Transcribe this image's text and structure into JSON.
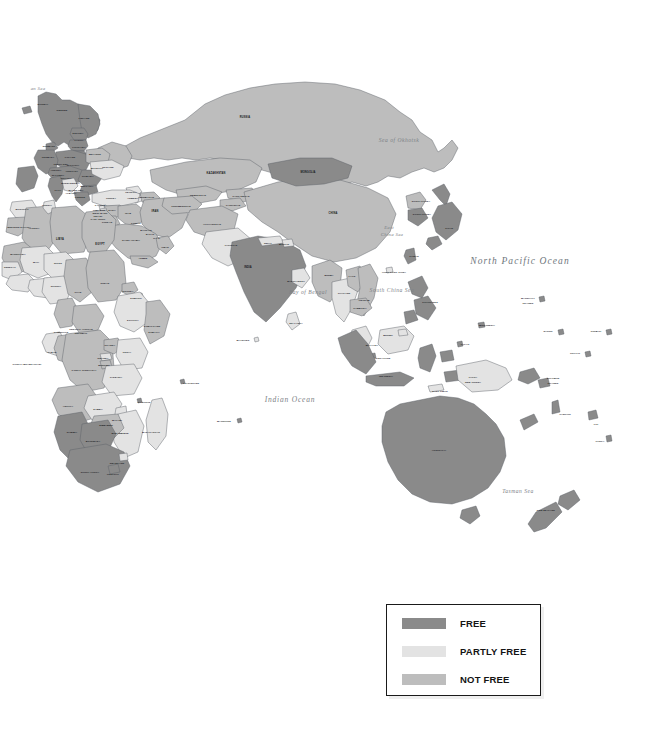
{
  "document": {
    "type": "world-freedom-map",
    "region_focus": "Europe, Africa, Asia, Oceania",
    "background_color": "#ffffff"
  },
  "legend": {
    "name": "freedom-status-legend",
    "border_color": "#1a1a1a",
    "items": [
      {
        "label": "FREE",
        "color": "#8a8a8a"
      },
      {
        "label": "PARTLY FREE",
        "color": "#e3e3e3"
      },
      {
        "label": "NOT FREE",
        "color": "#bdbdbd"
      }
    ]
  },
  "palette": {
    "free": "#8a8a8a",
    "partly_free": "#e3e3e3",
    "not_free": "#bdbdbd",
    "border": "#5b6066",
    "ocean": "#ffffff",
    "ocean_text": "#7c8186",
    "land_text": "#15171a"
  },
  "water_labels": [
    {
      "text": "an Sea",
      "x": 38,
      "y": 88,
      "size": "tiny"
    },
    {
      "text": "Sea of Okhotsk",
      "x": 399,
      "y": 140,
      "size": "sml"
    },
    {
      "text": "North Pacific Ocean",
      "x": 520,
      "y": 261,
      "size": "big"
    },
    {
      "text": "East",
      "x": 389,
      "y": 227,
      "size": "tiny"
    },
    {
      "text": "China Sea",
      "x": 392,
      "y": 234,
      "size": "tiny"
    },
    {
      "text": "South China Sea",
      "x": 392,
      "y": 290,
      "size": "sml"
    },
    {
      "text": "Bay of Bengal",
      "x": 308,
      "y": 292,
      "size": "sml"
    },
    {
      "text": "Indian Ocean",
      "x": 290,
      "y": 399,
      "size": "mid"
    },
    {
      "text": "Tasman Sea",
      "x": 518,
      "y": 491,
      "size": "sml"
    }
  ],
  "country_labels": [
    {
      "text": "NORWAY",
      "x": 43,
      "y": 104,
      "cls": "xs"
    },
    {
      "text": "SWEDEN",
      "x": 62,
      "y": 110,
      "cls": "xs"
    },
    {
      "text": "FINLAND",
      "x": 84,
      "y": 118,
      "cls": "xs"
    },
    {
      "text": "ESTONIA",
      "x": 78,
      "y": 133,
      "cls": "xs"
    },
    {
      "text": "LATVIA",
      "x": 79,
      "y": 140,
      "cls": "xs"
    },
    {
      "text": "LITHUANIA",
      "x": 79,
      "y": 147,
      "cls": "xs"
    },
    {
      "text": "DENMARK",
      "x": 49,
      "y": 146,
      "cls": "xs"
    },
    {
      "text": "BELARUS",
      "x": 95,
      "y": 154,
      "cls": "xs"
    },
    {
      "text": "POLAND",
      "x": 70,
      "y": 157,
      "cls": "xs"
    },
    {
      "text": "GERMANY",
      "x": 48,
      "y": 157,
      "cls": "xs"
    },
    {
      "text": "RUSSIA",
      "x": 245,
      "y": 118,
      "cls": "sm"
    },
    {
      "text": "UKRAINE",
      "x": 108,
      "y": 167,
      "cls": "xs"
    },
    {
      "text": "MOLDOVA",
      "x": 97,
      "y": 168,
      "cls": "xs"
    },
    {
      "text": "CZECH REP.",
      "x": 61,
      "y": 164,
      "cls": "xs"
    },
    {
      "text": "SLOVAKIA",
      "x": 73,
      "y": 165,
      "cls": "xs"
    },
    {
      "text": "AUSTRIA",
      "x": 56,
      "y": 170,
      "cls": "xs"
    },
    {
      "text": "HUNGARY",
      "x": 72,
      "y": 171,
      "cls": "xs"
    },
    {
      "text": "SLOVENIA",
      "x": 58,
      "y": 175,
      "cls": "xs"
    },
    {
      "text": "CROATIA",
      "x": 66,
      "y": 178,
      "cls": "xs"
    },
    {
      "text": "ROMANIA",
      "x": 88,
      "y": 176,
      "cls": "xs"
    },
    {
      "text": "BOSNIA",
      "x": 66,
      "y": 183,
      "cls": "xs"
    },
    {
      "text": "SERBIA",
      "x": 75,
      "y": 183,
      "cls": "xs"
    },
    {
      "text": "BULGARIA",
      "x": 87,
      "y": 186,
      "cls": "xs"
    },
    {
      "text": "ITALY",
      "x": 58,
      "y": 190,
      "cls": "xs"
    },
    {
      "text": "MACEDONIA",
      "x": 76,
      "y": 190,
      "cls": "xs"
    },
    {
      "text": "ALBANIA",
      "x": 71,
      "y": 193,
      "cls": "xs"
    },
    {
      "text": "GREECE",
      "x": 80,
      "y": 197,
      "cls": "xs"
    },
    {
      "text": "TURKEY",
      "x": 111,
      "y": 198,
      "cls": "xs"
    },
    {
      "text": "GEORGIA",
      "x": 131,
      "y": 192,
      "cls": "xs"
    },
    {
      "text": "ARMENIA",
      "x": 133,
      "y": 198,
      "cls": "xs"
    },
    {
      "text": "AZERBAIJAN",
      "x": 146,
      "y": 197,
      "cls": "xs"
    },
    {
      "text": "CYPRUS",
      "x": 100,
      "y": 205,
      "cls": "xs"
    },
    {
      "text": "SYRIA",
      "x": 112,
      "y": 210,
      "cls": "xs"
    },
    {
      "text": "LEBANON",
      "x": 99,
      "y": 210,
      "cls": "xs"
    },
    {
      "text": "ISRAEL",
      "x": 98,
      "y": 216,
      "cls": "xs"
    },
    {
      "text": "WEST BANK",
      "x": 100,
      "y": 213,
      "cls": "xs"
    },
    {
      "text": "GAZA STRIP",
      "x": 98,
      "y": 219,
      "cls": "xs"
    },
    {
      "text": "JORDAN",
      "x": 107,
      "y": 222,
      "cls": "xs"
    },
    {
      "text": "IRAQ",
      "x": 128,
      "y": 213,
      "cls": "xs"
    },
    {
      "text": "IRAN",
      "x": 155,
      "y": 212,
      "cls": "sm"
    },
    {
      "text": "KUWAIT",
      "x": 136,
      "y": 223,
      "cls": "xs"
    },
    {
      "text": "BAHRAIN",
      "x": 146,
      "y": 230,
      "cls": "xs"
    },
    {
      "text": "QATAR",
      "x": 150,
      "y": 234,
      "cls": "xs"
    },
    {
      "text": "U.A.E.",
      "x": 157,
      "y": 238,
      "cls": "xs"
    },
    {
      "text": "SAUDI ARABIA",
      "x": 131,
      "y": 240,
      "cls": "xs"
    },
    {
      "text": "OMAN",
      "x": 165,
      "y": 247,
      "cls": "xs"
    },
    {
      "text": "YEMEN",
      "x": 143,
      "y": 258,
      "cls": "xs"
    },
    {
      "text": "EGYPT",
      "x": 100,
      "y": 245,
      "cls": "sm"
    },
    {
      "text": "LIBYA",
      "x": 60,
      "y": 240,
      "cls": "sm"
    },
    {
      "text": "TUNISIA",
      "x": 47,
      "y": 205,
      "cls": "xs"
    },
    {
      "text": "MOROCCO",
      "x": 22,
      "y": 209,
      "cls": "xs"
    },
    {
      "text": "ALGERIA",
      "x": 34,
      "y": 228,
      "cls": "xs"
    },
    {
      "text": "WESTERN SAHARA",
      "x": 19,
      "y": 227,
      "cls": "xs"
    },
    {
      "text": "MAURITANIA",
      "x": 18,
      "y": 254,
      "cls": "xs"
    },
    {
      "text": "MALI",
      "x": 36,
      "y": 262,
      "cls": "xs"
    },
    {
      "text": "NIGER",
      "x": 58,
      "y": 263,
      "cls": "xs"
    },
    {
      "text": "SENEGAL",
      "x": 10,
      "y": 267,
      "cls": "xs"
    },
    {
      "text": "NIGERIA",
      "x": 56,
      "y": 286,
      "cls": "xs"
    },
    {
      "text": "CHAD",
      "x": 78,
      "y": 292,
      "cls": "xs"
    },
    {
      "text": "SUDAN",
      "x": 105,
      "y": 283,
      "cls": "xs"
    },
    {
      "text": "ERITREA",
      "x": 128,
      "y": 291,
      "cls": "xs"
    },
    {
      "text": "DJIBOUTI",
      "x": 136,
      "y": 298,
      "cls": "xs"
    },
    {
      "text": "ETHIOPIA",
      "x": 133,
      "y": 320,
      "cls": "xs"
    },
    {
      "text": "SOMALIA",
      "x": 154,
      "y": 332,
      "cls": "xs"
    },
    {
      "text": "SOMALILAND",
      "x": 152,
      "y": 326,
      "cls": "xs"
    },
    {
      "text": "CENTRAL AFRICAN",
      "x": 81,
      "y": 329,
      "cls": "xs"
    },
    {
      "text": "REPUBLIC",
      "x": 81,
      "y": 333,
      "cls": "xs"
    },
    {
      "text": "CAMEROON",
      "x": 61,
      "y": 332,
      "cls": "xs"
    },
    {
      "text": "GABON",
      "x": 52,
      "y": 352,
      "cls": "xs"
    },
    {
      "text": "CONGO (BRAZZAVILLE)",
      "x": 27,
      "y": 364,
      "cls": "xs"
    },
    {
      "text": "CONGO (KINSHASA)",
      "x": 84,
      "y": 370,
      "cls": "xs"
    },
    {
      "text": "RWANDA",
      "x": 103,
      "y": 358,
      "cls": "xs"
    },
    {
      "text": "BURUNDI",
      "x": 104,
      "y": 365,
      "cls": "xs"
    },
    {
      "text": "UGANDA",
      "x": 110,
      "y": 345,
      "cls": "xs"
    },
    {
      "text": "KENYA",
      "x": 127,
      "y": 352,
      "cls": "xs"
    },
    {
      "text": "TANZANIA",
      "x": 116,
      "y": 377,
      "cls": "xs"
    },
    {
      "text": "ANGOLA",
      "x": 68,
      "y": 406,
      "cls": "xs"
    },
    {
      "text": "ZAMBIA",
      "x": 98,
      "y": 409,
      "cls": "xs"
    },
    {
      "text": "MALAWI",
      "x": 117,
      "y": 420,
      "cls": "xs"
    },
    {
      "text": "ZIMBABWE",
      "x": 106,
      "y": 425,
      "cls": "xs"
    },
    {
      "text": "MOZAMBIQUE",
      "x": 120,
      "y": 433,
      "cls": "xs"
    },
    {
      "text": "NAMIBIA",
      "x": 72,
      "y": 432,
      "cls": "xs"
    },
    {
      "text": "BOTSWANA",
      "x": 93,
      "y": 441,
      "cls": "xs"
    },
    {
      "text": "SWAZILAND",
      "x": 117,
      "y": 463,
      "cls": "xs"
    },
    {
      "text": "LESOTHO",
      "x": 113,
      "y": 474,
      "cls": "xs"
    },
    {
      "text": "SOUTH AFRICA",
      "x": 90,
      "y": 472,
      "cls": "xs"
    },
    {
      "text": "MADAGASCAR",
      "x": 151,
      "y": 432,
      "cls": "xs"
    },
    {
      "text": "COMOROS",
      "x": 144,
      "y": 402,
      "cls": "xs"
    },
    {
      "text": "SEYCHELLES",
      "x": 191,
      "y": 383,
      "cls": "xs"
    },
    {
      "text": "MAURITIUS",
      "x": 224,
      "y": 421,
      "cls": "xs"
    },
    {
      "text": "MALDIVES",
      "x": 243,
      "y": 340,
      "cls": "xs"
    },
    {
      "text": "KAZAKHSTAN",
      "x": 216,
      "y": 174,
      "cls": "sm"
    },
    {
      "text": "UZBEKISTAN",
      "x": 198,
      "y": 195,
      "cls": "xs"
    },
    {
      "text": "TURKMENISTAN",
      "x": 181,
      "y": 206,
      "cls": "xs"
    },
    {
      "text": "KYRGYZSTAN",
      "x": 241,
      "y": 196,
      "cls": "xs"
    },
    {
      "text": "TAJIKISTAN",
      "x": 233,
      "y": 205,
      "cls": "xs"
    },
    {
      "text": "AFGHANISTAN",
      "x": 212,
      "y": 224,
      "cls": "xs"
    },
    {
      "text": "PAKISTAN",
      "x": 231,
      "y": 245,
      "cls": "xs"
    },
    {
      "text": "MONGOLIA",
      "x": 308,
      "y": 173,
      "cls": "sm"
    },
    {
      "text": "CHINA",
      "x": 333,
      "y": 214,
      "cls": "sm"
    },
    {
      "text": "NEPAL",
      "x": 268,
      "y": 243,
      "cls": "xs"
    },
    {
      "text": "BHUTAN",
      "x": 284,
      "y": 244,
      "cls": "xs"
    },
    {
      "text": "INDIA",
      "x": 248,
      "y": 268,
      "cls": "sm"
    },
    {
      "text": "BANGLADESH",
      "x": 296,
      "y": 281,
      "cls": "xs"
    },
    {
      "text": "SRI LANKA",
      "x": 296,
      "y": 323,
      "cls": "xs"
    },
    {
      "text": "BURMA",
      "x": 329,
      "y": 275,
      "cls": "xs"
    },
    {
      "text": "LAOS",
      "x": 352,
      "y": 276,
      "cls": "xs"
    },
    {
      "text": "THAILAND",
      "x": 344,
      "y": 293,
      "cls": "xs"
    },
    {
      "text": "VIETNAM",
      "x": 364,
      "y": 300,
      "cls": "xs"
    },
    {
      "text": "CAMBODIA",
      "x": 360,
      "y": 308,
      "cls": "xs"
    },
    {
      "text": "MALAYSIA",
      "x": 372,
      "y": 345,
      "cls": "xs"
    },
    {
      "text": "SINGAPORE",
      "x": 383,
      "y": 358,
      "cls": "xs"
    },
    {
      "text": "BRUNEI",
      "x": 388,
      "y": 335,
      "cls": "xs"
    },
    {
      "text": "INDONESIA",
      "x": 386,
      "y": 376,
      "cls": "xs"
    },
    {
      "text": "EAST TIMOR",
      "x": 440,
      "y": 391,
      "cls": "xs"
    },
    {
      "text": "PHILIPPINES",
      "x": 430,
      "y": 302,
      "cls": "xs"
    },
    {
      "text": "TAIWAN",
      "x": 414,
      "y": 256,
      "cls": "xs"
    },
    {
      "text": "HONG KONG CHINA",
      "x": 394,
      "y": 272,
      "cls": "xs"
    },
    {
      "text": "NORTH KOREA",
      "x": 421,
      "y": 201,
      "cls": "xs"
    },
    {
      "text": "SOUTH KOREA",
      "x": 422,
      "y": 214,
      "cls": "xs"
    },
    {
      "text": "JAPAN",
      "x": 449,
      "y": 228,
      "cls": "xs"
    },
    {
      "text": "PALAU",
      "x": 465,
      "y": 344,
      "cls": "xs"
    },
    {
      "text": "MICRONESIA",
      "x": 487,
      "y": 325,
      "cls": "xs"
    },
    {
      "text": "MARSHALL",
      "x": 528,
      "y": 298,
      "cls": "xs"
    },
    {
      "text": "ISLANDS",
      "x": 528,
      "y": 303,
      "cls": "xs"
    },
    {
      "text": "NAURU",
      "x": 548,
      "y": 331,
      "cls": "xs"
    },
    {
      "text": "KIRIBATI",
      "x": 596,
      "y": 331,
      "cls": "xs"
    },
    {
      "text": "TUVALU",
      "x": 575,
      "y": 353,
      "cls": "xs"
    },
    {
      "text": "PAPUA",
      "x": 473,
      "y": 377,
      "cls": "xs"
    },
    {
      "text": "NEW GUINEA",
      "x": 473,
      "y": 382,
      "cls": "xs"
    },
    {
      "text": "SOLOMON",
      "x": 553,
      "y": 378,
      "cls": "xs"
    },
    {
      "text": "ISLANDS",
      "x": 553,
      "y": 383,
      "cls": "xs"
    },
    {
      "text": "VANUATU",
      "x": 565,
      "y": 414,
      "cls": "xs"
    },
    {
      "text": "FIJI",
      "x": 596,
      "y": 424,
      "cls": "xs"
    },
    {
      "text": "TONGA",
      "x": 600,
      "y": 441,
      "cls": "xs"
    },
    {
      "text": "AUSTRALIA",
      "x": 439,
      "y": 450,
      "cls": "xs"
    },
    {
      "text": "NEW ZEALAND",
      "x": 546,
      "y": 510,
      "cls": "xs"
    }
  ]
}
